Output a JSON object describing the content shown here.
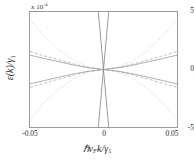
{
  "chart_data": {
    "type": "line",
    "title": "",
    "xlabel": "ℋv_F k/γ₁",
    "ylabel": "ε(k)/γ₁",
    "xlim": [
      -0.05,
      0.05
    ],
    "ylim": [
      -5,
      5
    ],
    "y_multiplier": "x 10",
    "y_multiplier_exponent": "-4",
    "grid": false,
    "legend": null,
    "xticks": [
      "-0.05",
      "0",
      "0.05"
    ],
    "xtick_values": [
      -0.05,
      0,
      0.05
    ],
    "yticks": [
      "5",
      "0",
      "-5"
    ],
    "ytick_values": [
      5,
      0,
      -5
    ],
    "series": [
      {
        "name": "linear-band-positive-slope",
        "style": "solid",
        "color": "#6f6f6f",
        "x": [
          -0.0035,
          0.0035
        ],
        "values": [
          -5.0,
          5.0
        ]
      },
      {
        "name": "linear-band-negative-slope",
        "style": "solid",
        "color": "#6f6f6f",
        "x": [
          -0.0035,
          0.0035
        ],
        "values": [
          5.0,
          -5.0
        ]
      },
      {
        "name": "upper-flat-band-solid",
        "style": "solid",
        "color": "#8a8a8a",
        "x": [
          -0.05,
          -0.04,
          -0.03,
          -0.02,
          -0.01,
          0,
          0.01,
          0.02,
          0.03,
          0.04,
          0.05
        ],
        "values": [
          1.25,
          0.95,
          0.66,
          0.38,
          0.14,
          0.0,
          0.14,
          0.38,
          0.66,
          0.95,
          1.25
        ]
      },
      {
        "name": "lower-flat-band-solid",
        "style": "solid",
        "color": "#8a8a8a",
        "x": [
          -0.05,
          -0.04,
          -0.03,
          -0.02,
          -0.01,
          0,
          0.01,
          0.02,
          0.03,
          0.04,
          0.05
        ],
        "values": [
          -1.25,
          -0.95,
          -0.66,
          -0.38,
          -0.14,
          0.0,
          -0.14,
          -0.38,
          -0.66,
          -0.95,
          -1.25
        ]
      },
      {
        "name": "upper-band-dashed",
        "style": "dashed",
        "color": "#9c9c9c",
        "x": [
          -0.05,
          -0.04,
          -0.03,
          -0.02,
          -0.01,
          0,
          0.01,
          0.02,
          0.03,
          0.04,
          0.05
        ],
        "values": [
          1.55,
          1.18,
          0.82,
          0.48,
          0.18,
          0.0,
          0.18,
          0.48,
          0.82,
          1.18,
          1.55
        ]
      },
      {
        "name": "lower-band-dashed",
        "style": "dashed",
        "color": "#9c9c9c",
        "x": [
          -0.05,
          -0.04,
          -0.03,
          -0.02,
          -0.01,
          0,
          0.01,
          0.02,
          0.03,
          0.04,
          0.05
        ],
        "values": [
          -1.55,
          -1.18,
          -0.82,
          -0.48,
          -0.18,
          0.0,
          -0.18,
          -0.48,
          -0.82,
          -1.18,
          -1.55
        ]
      },
      {
        "name": "upper-parabolic-band-dotted",
        "style": "dotted",
        "color": "#b0b0b0",
        "x": [
          -0.05,
          -0.04,
          -0.03,
          -0.02,
          -0.01,
          0,
          0.01,
          0.02,
          0.03,
          0.04,
          0.05
        ],
        "values": [
          4.35,
          2.85,
          1.65,
          0.78,
          0.22,
          0.0,
          0.22,
          0.78,
          1.65,
          2.85,
          4.35
        ]
      },
      {
        "name": "lower-parabolic-band-dotted",
        "style": "dotted",
        "color": "#b0b0b0",
        "x": [
          -0.05,
          -0.04,
          -0.03,
          -0.02,
          -0.01,
          0,
          0.01,
          0.02,
          0.03,
          0.04,
          0.05
        ],
        "values": [
          -4.35,
          -2.85,
          -1.65,
          -0.78,
          -0.22,
          0.0,
          -0.22,
          -0.78,
          -1.65,
          -2.85,
          -4.35
        ]
      }
    ]
  }
}
